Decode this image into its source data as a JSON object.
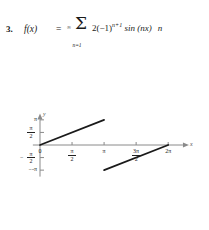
{
  "problem": {
    "number": "3.",
    "function_name": "f(x)",
    "equals": "=",
    "sum_upper": "∞",
    "sum_symbol": "Σ",
    "sum_lower": "n=1",
    "numerator_prefix": "2(−1)",
    "numerator_exponent": "n+1",
    "numerator_suffix": "sin (nx)",
    "denominator": "n",
    "full_expression": "f(x) = Σ(n=1 to ∞) 2(−1)^(n+1) sin(nx) / n"
  },
  "chart_data": {
    "type": "line",
    "title": "",
    "xlabel": "x",
    "ylabel": "y",
    "xlim": [
      -0.35,
      7.3
    ],
    "ylim": [
      -3.95,
      3.95
    ],
    "grid": false,
    "legend": null,
    "x_ticks": [
      {
        "value": 0,
        "label": "0",
        "kind": "plain"
      },
      {
        "value": 1.5707963,
        "label": "π/2",
        "kind": "fraction",
        "num": "π",
        "den": "2"
      },
      {
        "value": 3.1415927,
        "label": "π",
        "kind": "plain"
      },
      {
        "value": 4.712389,
        "label": "3π/2",
        "kind": "fraction",
        "num": "3π",
        "den": "2"
      },
      {
        "value": 6.2831853,
        "label": "2π",
        "kind": "plain"
      }
    ],
    "y_ticks": [
      {
        "value": 3.1415927,
        "label": "π",
        "kind": "plain"
      },
      {
        "value": 1.5707963,
        "label": "π/2",
        "kind": "fraction",
        "num": "π",
        "den": "2"
      },
      {
        "value": -1.5707963,
        "label": "-π/2",
        "kind": "fraction",
        "num": "π",
        "den": "2",
        "negative": true
      },
      {
        "value": -3.1415927,
        "label": "-π",
        "kind": "plain",
        "negative": true
      }
    ],
    "series": [
      {
        "name": "segment-1",
        "points": [
          [
            0,
            0
          ],
          [
            3.1415927,
            3.1415927
          ]
        ]
      },
      {
        "name": "segment-2",
        "points": [
          [
            3.1415927,
            -3.1415927
          ],
          [
            6.2831853,
            0
          ]
        ]
      }
    ],
    "colors": {
      "axis": "#8a8a8a",
      "curve": "#1a1a1a",
      "tick_text": "#222222"
    }
  }
}
